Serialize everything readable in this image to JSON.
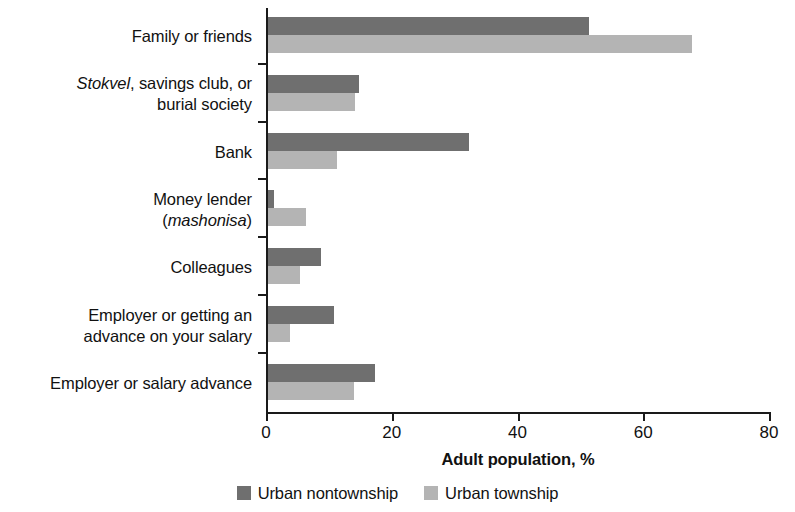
{
  "chart_data": {
    "type": "bar",
    "orientation": "horizontal",
    "title": "",
    "xlabel": "Adult population, %",
    "ylabel": "",
    "xlim": [
      0,
      80
    ],
    "xticks": [
      0,
      20,
      40,
      60,
      80
    ],
    "xtick_labels": [
      "0",
      "20",
      "40",
      "60",
      "80"
    ],
    "grid": false,
    "legend_position": "bottom-center",
    "categories": [
      "Family or friends",
      "Stokvel, savings club, or burial society",
      "Bank",
      "Money lender (mashonisa)",
      "Colleagues",
      "Employer or getting an advance on your salary",
      "Employer or salary advance"
    ],
    "series": [
      {
        "name": "Urban nontownship",
        "color": "#6f6f6f",
        "values": [
          51,
          14.5,
          32,
          1,
          8.4,
          10.5,
          17
        ]
      },
      {
        "name": "Urban township",
        "color": "#b4b4b4",
        "values": [
          67.5,
          13.8,
          11,
          6,
          5.1,
          3.5,
          13.7
        ]
      }
    ]
  },
  "axis": {
    "x_title": "Adult population, %",
    "ticks": [
      {
        "label": "0",
        "value": 0
      },
      {
        "label": "20",
        "value": 20
      },
      {
        "label": "40",
        "value": 40
      },
      {
        "label": "60",
        "value": 60
      },
      {
        "label": "80",
        "value": 80
      }
    ]
  },
  "categories": [
    {
      "id": "family-or-friends",
      "line1": "Family or friends",
      "line2": "",
      "line1_italic_prefix": "",
      "dark": 51,
      "light": 67.5
    },
    {
      "id": "stokvel-savings-club-burial-society",
      "line1": ", savings club, or",
      "line2": "burial society",
      "line1_italic_prefix": "Stokvel",
      "dark": 14.5,
      "light": 13.8
    },
    {
      "id": "bank",
      "line1": "Bank",
      "line2": "",
      "line1_italic_prefix": "",
      "dark": 32,
      "light": 11
    },
    {
      "id": "money-lender-mashonisa",
      "line1": "Money lender",
      "line2": "mashonisa",
      "line1_italic_prefix": "",
      "dark": 1,
      "light": 6
    },
    {
      "id": "colleagues",
      "line1": "Colleagues",
      "line2": "",
      "line1_italic_prefix": "",
      "dark": 8.4,
      "light": 5.1
    },
    {
      "id": "employer-or-getting-an-advance-on-your-salary",
      "line1": "Employer or getting an",
      "line2": "advance on your salary",
      "line1_italic_prefix": "",
      "dark": 10.5,
      "light": 3.5
    },
    {
      "id": "employer-or-salary-advance",
      "line1": "Employer or salary advance",
      "line2": "",
      "line1_italic_prefix": "",
      "dark": 17,
      "light": 13.7
    }
  ],
  "legend": {
    "items": [
      {
        "label": "Urban nontownship",
        "color": "#6f6f6f"
      },
      {
        "label": "Urban township",
        "color": "#b4b4b4"
      }
    ]
  },
  "colors": {
    "series_dark": "#6f6f6f",
    "series_light": "#b4b4b4",
    "axis": "#1a1a1a",
    "text": "#111111",
    "background": "#ffffff"
  }
}
